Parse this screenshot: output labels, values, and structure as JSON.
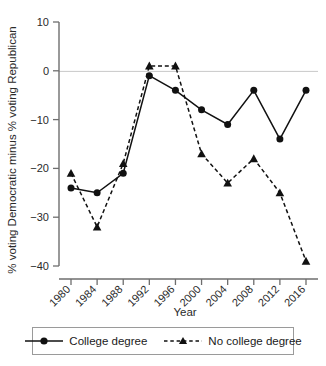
{
  "chart_data": {
    "type": "line",
    "title": "",
    "xlabel": "Year",
    "ylabel": "% voting Democratic minus % voting Republican",
    "categories": [
      1980,
      1984,
      1988,
      1992,
      1996,
      2000,
      2004,
      2008,
      2012,
      2016
    ],
    "xtick_labels": [
      "1980",
      "1984",
      "1988",
      "1992",
      "1996",
      "2000",
      "2004",
      "2008",
      "2012",
      "2016"
    ],
    "ytick_labels": [
      "10",
      "0",
      "-10",
      "-20",
      "-30",
      "-40"
    ],
    "ytick_values": [
      10,
      0,
      -10,
      -20,
      -30,
      -40
    ],
    "ylim": [
      -42,
      12
    ],
    "xlim": [
      1978,
      2018
    ],
    "grid": false,
    "zero_line": true,
    "legend_position": "below",
    "series": [
      {
        "name": "College degree",
        "marker": "circle",
        "line_style": "solid",
        "color": "#111111",
        "values": [
          -24,
          -25,
          -21,
          -1,
          -4,
          -8,
          -11,
          -4,
          -14,
          -4
        ]
      },
      {
        "name": "No college degree",
        "marker": "triangle",
        "line_style": "dashed",
        "color": "#111111",
        "values": [
          -21,
          -32,
          -19,
          1,
          1,
          -17,
          -23,
          -18,
          -25,
          -39
        ]
      }
    ]
  },
  "legend": {
    "items": [
      {
        "label": "College degree",
        "marker": "circle-marker",
        "style": "solid"
      },
      {
        "label": "No college degree",
        "marker": "triangle-marker",
        "style": "dashed"
      }
    ]
  },
  "axes": {
    "x_title": "Year",
    "y_title": "% voting Democratic minus % voting Republican"
  }
}
